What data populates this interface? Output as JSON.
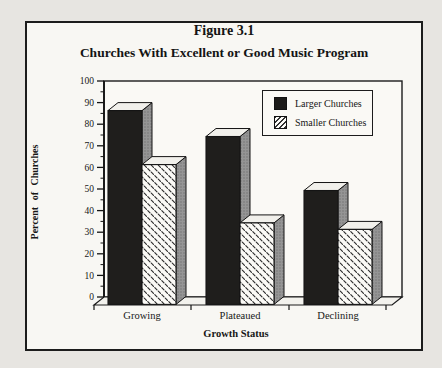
{
  "figure": {
    "title": "Figure 3.1",
    "subtitle": "Churches With Excellent or Good Music Program"
  },
  "chart_data": {
    "type": "bar",
    "style": "3d-column",
    "title": "Churches With Excellent or Good Music Program",
    "categories": [
      "Growing",
      "Plateaued",
      "Declining"
    ],
    "series": [
      {
        "name": "Larger Churches",
        "fill": "solid-black",
        "values": [
          90,
          78,
          53
        ]
      },
      {
        "name": "Smaller Churches",
        "fill": "diagonal-dash-hatch",
        "values": [
          65,
          38,
          35
        ]
      }
    ],
    "xlabel": "Growth Status",
    "ylabel": "Percent of Churches",
    "ylim": [
      0,
      100
    ],
    "yticks": [
      0,
      10,
      20,
      30,
      40,
      50,
      60,
      70,
      80,
      90,
      100
    ],
    "ytick_minor_step": 5,
    "grid": false,
    "legend_position": "upper-right"
  },
  "colors": {
    "larger_bar": "#1f1e1c",
    "hatch_stroke": "#2b2b2b",
    "bar_side": "#959595",
    "bar_side_dot": "#6d6d6d",
    "bar_top": "#f1f0eb",
    "frame_border": "#1c1c1c",
    "paper": "#f8f7f3",
    "page_bg": "#e7e5e1"
  }
}
